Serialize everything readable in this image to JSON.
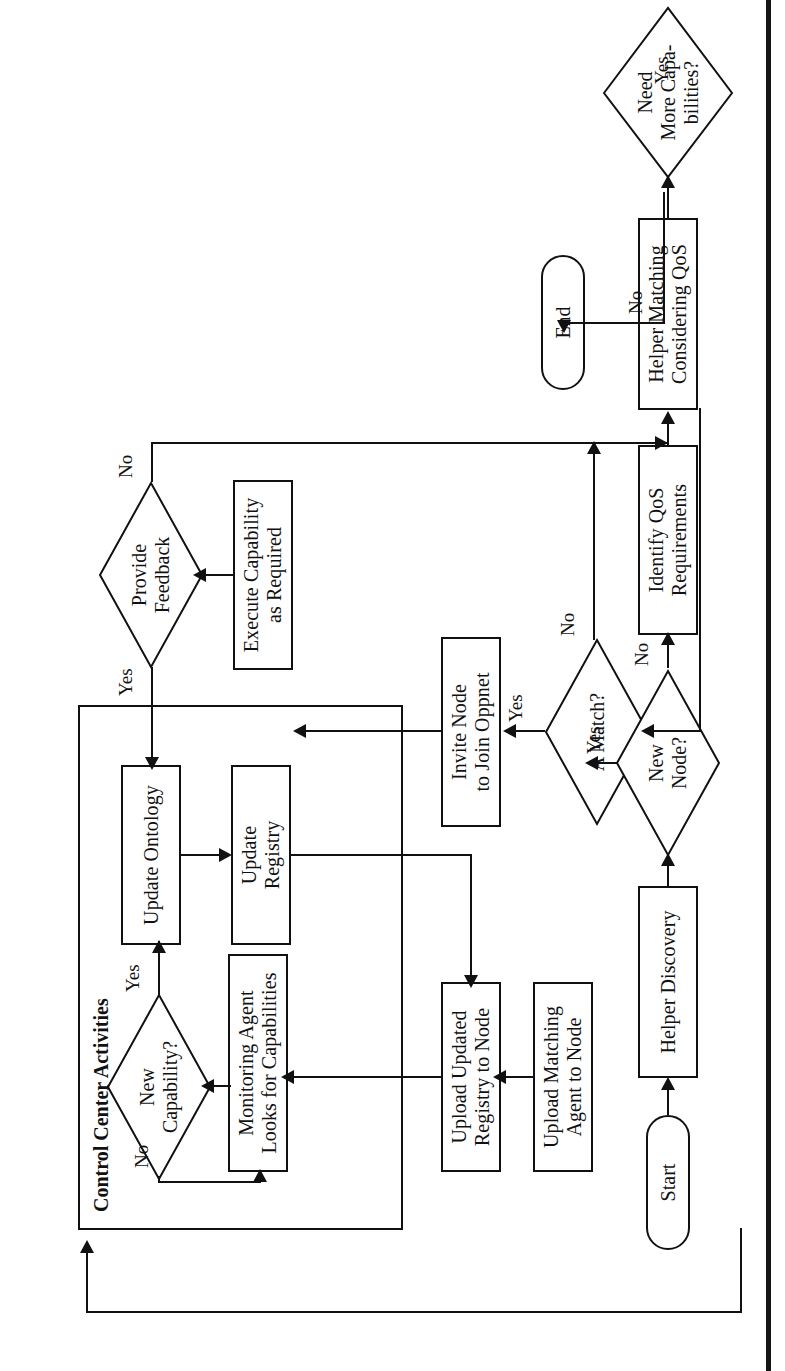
{
  "figure": {
    "type": "flowchart",
    "orientation": "rotated-90-ccw",
    "group_label": "Control Center Activities",
    "nodes": [
      {
        "id": "start",
        "shape": "terminator",
        "label": "Start"
      },
      {
        "id": "helper_discovery",
        "shape": "process",
        "label": "Helper Discovery"
      },
      {
        "id": "new_node",
        "shape": "decision",
        "label": "New\nNode?"
      },
      {
        "id": "upload_matching",
        "shape": "process",
        "label": "Upload Matching\nAgent to Node"
      },
      {
        "id": "upload_registry",
        "shape": "process",
        "label": "Upload Updated\nRegistry to Node"
      },
      {
        "id": "monitoring_agent",
        "shape": "process",
        "label": "Monitoring Agent\nLooks for Capabilities"
      },
      {
        "id": "new_capability",
        "shape": "decision",
        "label": "New\nCapability?"
      },
      {
        "id": "update_ontology",
        "shape": "process",
        "label": "Update Ontology"
      },
      {
        "id": "update_registry",
        "shape": "process",
        "label": "Update\nRegistry"
      },
      {
        "id": "provide_feedback",
        "shape": "decision",
        "label": "Provide\nFeedback"
      },
      {
        "id": "execute_capability",
        "shape": "process",
        "label": "Execute Capability\nas Required"
      },
      {
        "id": "invite_node",
        "shape": "process",
        "label": "Invite Node\nto Join Oppnet"
      },
      {
        "id": "a_match",
        "shape": "decision",
        "label": "A Match?"
      },
      {
        "id": "identify_qos",
        "shape": "process",
        "label": "Identify QoS\nRequirements"
      },
      {
        "id": "helper_matching",
        "shape": "process",
        "label": "Helper Matching\nConsidering QoS"
      },
      {
        "id": "need_more",
        "shape": "decision",
        "label": "Need\nMore Capa-\nbilities?"
      },
      {
        "id": "end",
        "shape": "terminator",
        "label": "End"
      }
    ],
    "edges": [
      {
        "from": "start",
        "to": "helper_discovery",
        "label": ""
      },
      {
        "from": "helper_discovery",
        "to": "new_node",
        "label": ""
      },
      {
        "from": "new_node",
        "to": "upload_matching",
        "label": "Yes"
      },
      {
        "from": "new_node",
        "to": "identify_qos",
        "label": "No"
      },
      {
        "from": "upload_matching",
        "to": "upload_registry",
        "label": ""
      },
      {
        "from": "upload_registry",
        "to": "monitoring_agent",
        "label": ""
      },
      {
        "from": "monitoring_agent",
        "to": "new_capability",
        "label": ""
      },
      {
        "from": "new_capability",
        "to": "update_ontology",
        "label": "Yes"
      },
      {
        "from": "new_capability",
        "to": "monitoring_agent",
        "label": "No"
      },
      {
        "from": "update_ontology",
        "to": "update_registry",
        "label": ""
      },
      {
        "from": "update_registry",
        "to": "upload_registry",
        "label": ""
      },
      {
        "from": "provide_feedback",
        "to": "update_ontology",
        "label": "Yes"
      },
      {
        "from": "provide_feedback",
        "to": "need_more",
        "label": "No"
      },
      {
        "from": "execute_capability",
        "to": "provide_feedback",
        "label": ""
      },
      {
        "from": "invite_node",
        "to": "execute_capability",
        "label": ""
      },
      {
        "from": "a_match",
        "to": "invite_node",
        "label": "Yes"
      },
      {
        "from": "a_match",
        "to": "need_more",
        "label": "No"
      },
      {
        "from": "identify_qos",
        "to": "helper_matching",
        "label": ""
      },
      {
        "from": "helper_matching",
        "to": "a_match",
        "label": ""
      },
      {
        "from": "helper_matching",
        "to": "need_more",
        "label": ""
      },
      {
        "from": "need_more",
        "to": "end",
        "label": "No"
      },
      {
        "from": "need_more",
        "to": "helper_discovery",
        "label": "Yes"
      }
    ],
    "edge_labels": {
      "new_node_yes": "Yes",
      "new_node_no": "No",
      "new_capability_yes": "Yes",
      "new_capability_no": "No",
      "provide_feedback_yes": "Yes",
      "provide_feedback_no": "No",
      "a_match_yes": "Yes",
      "a_match_no": "No",
      "need_more_no": "No",
      "need_more_yes": "Yes"
    },
    "labels": {
      "start": "Start",
      "helper_discovery": "Helper Discovery",
      "new_node_l1": "New",
      "new_node_l2": "Node?",
      "upload_matching_l1": "Upload Matching",
      "upload_matching_l2": "Agent to Node",
      "upload_registry_l1": "Upload Updated",
      "upload_registry_l2": "Registry to Node",
      "monitoring_agent_l1": "Monitoring Agent",
      "monitoring_agent_l2": "Looks for Capabilities",
      "new_capability_l1": "New",
      "new_capability_l2": "Capability?",
      "update_ontology": "Update Ontology",
      "update_registry_l1": "Update",
      "update_registry_l2": "Registry",
      "provide_feedback_l1": "Provide",
      "provide_feedback_l2": "Feedback",
      "execute_capability_l1": "Execute Capability",
      "execute_capability_l2": "as Required",
      "invite_node_l1": "Invite Node",
      "invite_node_l2": "to Join Oppnet",
      "a_match": "A Match?",
      "identify_qos_l1": "Identify QoS",
      "identify_qos_l2": "Requirements",
      "helper_matching_l1": "Helper Matching",
      "helper_matching_l2": "Considering QoS",
      "need_more_l1": "Need",
      "need_more_l2": "More Capa-",
      "need_more_l3": "bilities?",
      "end": "End"
    },
    "colors": {
      "stroke": "#111111",
      "background": "#ffffff",
      "page_edge": "#141414"
    }
  }
}
